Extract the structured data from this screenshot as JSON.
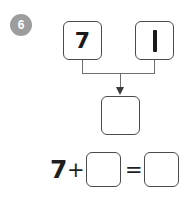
{
  "problem": {
    "number": "6",
    "type": "addition-number-bond"
  },
  "number_bond": {
    "addend_a": "7",
    "addend_b": "1",
    "sum": "",
    "arrow_icon": "down-arrow-icon"
  },
  "equation": {
    "first_term": "7",
    "plus_sign": "+",
    "second_term": "",
    "equals_sign": "=",
    "result": ""
  },
  "colors": {
    "badge_background": "#9d9d9d",
    "badge_text": "#ffffff",
    "box_border": "#4a4a4a",
    "connector": "#6e6e6e",
    "arrowhead": "#3a3a3a",
    "glyph": "#1f1f1f",
    "page_background": "#ffffff"
  }
}
